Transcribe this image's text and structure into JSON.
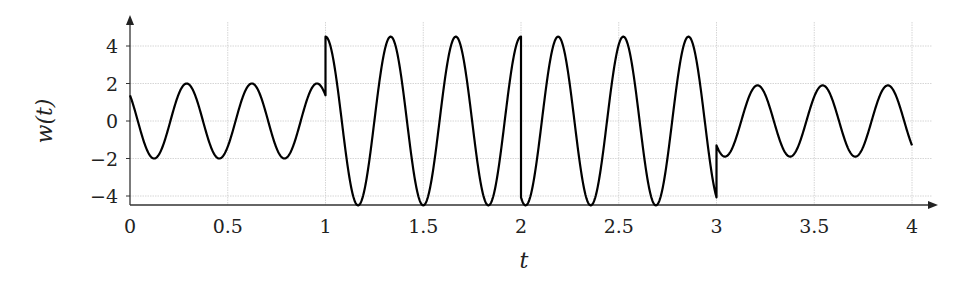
{
  "chart_data": {
    "type": "line",
    "title": "",
    "xlabel": "t",
    "ylabel": "w(t)",
    "xlim": [
      0,
      4
    ],
    "ylim": [
      -4.5,
      4.5
    ],
    "x_ticks": [
      0,
      0.5,
      1,
      1.5,
      2,
      2.5,
      3,
      3.5,
      4
    ],
    "x_tick_labels": [
      "0",
      "0.5",
      "1",
      "1.5",
      "2",
      "2.5",
      "3",
      "3.5",
      "4"
    ],
    "y_ticks": [
      -4,
      -2,
      0,
      2,
      4
    ],
    "y_tick_labels": [
      "−4",
      "−2",
      "0",
      "2",
      "4"
    ],
    "grid": true,
    "legend": null,
    "series": [
      {
        "name": "w(t)",
        "color": "#000000",
        "piecewise": [
          {
            "t_range": [
              0,
              1
            ],
            "formula": "2*cos(6*pi*(t-0.29))",
            "amplitude": 2,
            "period": 0.333
          },
          {
            "t_range": [
              1,
              2
            ],
            "formula": "4.5*cos(6*pi*(t-1))",
            "amplitude": 4.5,
            "period": 0.333
          },
          {
            "t_range": [
              2,
              3
            ],
            "formula": "4.5*cos(6*pi*(t-2.19))",
            "amplitude": 4.5,
            "period": 0.333
          },
          {
            "t_range": [
              3,
              4
            ],
            "formula": "1.9*cos(6*pi*(t-3.21))",
            "amplitude": 1.9,
            "period": 0.333
          }
        ],
        "points": [
          [
            0,
            1.4
          ],
          [
            0.13,
            -2
          ],
          [
            0.29,
            2
          ],
          [
            0.46,
            -2
          ],
          [
            0.63,
            2
          ],
          [
            0.79,
            -2
          ],
          [
            0.96,
            2
          ],
          [
            1.0,
            1.4
          ],
          [
            1.0,
            4.5
          ],
          [
            1.16,
            -4.5
          ],
          [
            1.33,
            4.5
          ],
          [
            1.5,
            -4.5
          ],
          [
            1.66,
            4.5
          ],
          [
            1.83,
            -4.5
          ],
          [
            2.0,
            4.5
          ],
          [
            2.0,
            -4.1
          ],
          [
            2.02,
            -4.5
          ],
          [
            2.19,
            4.5
          ],
          [
            2.35,
            -4.5
          ],
          [
            2.52,
            4.5
          ],
          [
            2.69,
            -4.5
          ],
          [
            2.86,
            4.5
          ],
          [
            3.0,
            -4.1
          ],
          [
            3.0,
            -1.3
          ],
          [
            3.04,
            -1.9
          ],
          [
            3.21,
            1.9
          ],
          [
            3.38,
            -1.9
          ],
          [
            3.55,
            1.9
          ],
          [
            3.71,
            -1.9
          ],
          [
            3.88,
            1.9
          ],
          [
            4.0,
            -1.3
          ]
        ]
      }
    ]
  }
}
